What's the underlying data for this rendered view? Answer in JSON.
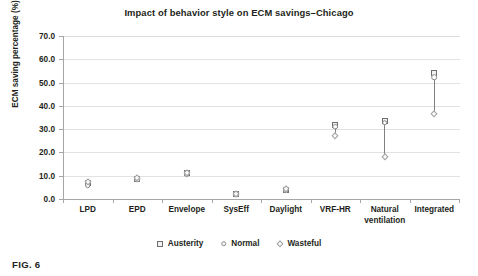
{
  "figure": {
    "caption": "FIG. 6"
  },
  "chart_data": {
    "type": "scatter",
    "title": "Impact of behavior style on ECM savings–Chicago",
    "xlabel": "",
    "ylabel": "ECM saving percentage (%)",
    "ylim": [
      0,
      70
    ],
    "ytick_labels": [
      "0.0",
      "10.0",
      "20.0",
      "30.0",
      "40.0",
      "50.0",
      "60.0",
      "70.0"
    ],
    "ytick_values": [
      0,
      10,
      20,
      30,
      40,
      50,
      60,
      70
    ],
    "grid": true,
    "legend_position": "bottom",
    "categories": [
      "LPD",
      "EPD",
      "Envelope",
      "SysEff",
      "Daylight",
      "VRF-HR",
      "Natural ventilation",
      "Integrated"
    ],
    "category_label_lines": [
      [
        "LPD",
        ""
      ],
      [
        "EPD",
        ""
      ],
      [
        "Envelope",
        ""
      ],
      [
        "SysEff",
        ""
      ],
      [
        "Daylight",
        ""
      ],
      [
        "VRF-HR",
        ""
      ],
      [
        "Natural",
        "ventilation"
      ],
      [
        "Integrated",
        ""
      ]
    ],
    "series": [
      {
        "name": "Austerity",
        "marker": "square",
        "values": [
          6.7,
          8.8,
          11.2,
          2.1,
          4.0,
          31.8,
          33.3,
          54.0
        ]
      },
      {
        "name": "Normal",
        "marker": "circle",
        "values": [
          6.0,
          8.2,
          10.6,
          1.9,
          3.8,
          31.0,
          32.8,
          52.4
        ]
      },
      {
        "name": "Wasteful",
        "marker": "diamond",
        "values": [
          7.4,
          9.1,
          11.0,
          2.0,
          4.2,
          27.0,
          18.1,
          36.4
        ]
      }
    ],
    "legend": [
      {
        "label": "Austerity",
        "marker": "square"
      },
      {
        "label": "Normal",
        "marker": "circle"
      },
      {
        "label": "Wasteful",
        "marker": "diamond"
      }
    ],
    "colors": {
      "marker_stroke": "#6e6e6e",
      "connector": "#808080",
      "grid": "#e2e2e2",
      "axis": "#a6a6a6",
      "text": "#231f20"
    }
  }
}
